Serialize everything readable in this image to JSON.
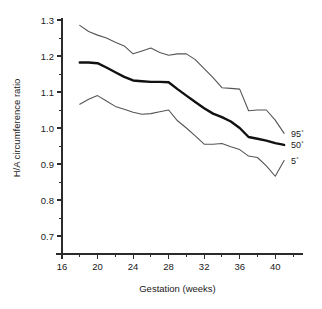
{
  "chart_data": {
    "type": "line",
    "title": "",
    "xlabel": "Gestation (weeks)",
    "ylabel": "H/A circumference ratio",
    "xlim": [
      16,
      42
    ],
    "ylim": [
      0.65,
      1.3
    ],
    "grid": false,
    "legend_position": "right-inline",
    "x_ticks_major": [
      16,
      20,
      24,
      28,
      32,
      36,
      40
    ],
    "x_ticks_minor": [
      18,
      22,
      26,
      30,
      34,
      38,
      42
    ],
    "y_ticks_major": [
      0.7,
      0.8,
      0.9,
      1.0,
      1.1,
      1.2,
      1.3
    ],
    "y_ticks_minor": [
      0.75,
      0.85,
      0.95,
      1.05,
      1.15,
      1.25
    ],
    "x_tick_labels": [
      "16",
      "20",
      "24",
      "28",
      "32",
      "36",
      "40"
    ],
    "y_tick_labels": [
      "0.7",
      "0.8",
      "0.9",
      "1.0",
      "1.1",
      "1.2",
      "1.3"
    ],
    "x": [
      18,
      19,
      20,
      21,
      22,
      23,
      24,
      25,
      26,
      27,
      28,
      29,
      30,
      31,
      32,
      33,
      34,
      35,
      36,
      37,
      38,
      39,
      40,
      41
    ],
    "series": [
      {
        "name": "95th percentile",
        "label": "95",
        "superscript": "°",
        "style": "thin",
        "color": "#555555",
        "values": [
          1.285,
          1.268,
          1.258,
          1.25,
          1.238,
          1.228,
          1.206,
          1.214,
          1.222,
          1.21,
          1.202,
          1.206,
          1.206,
          1.19,
          1.165,
          1.14,
          1.112,
          1.11,
          1.108,
          1.048,
          1.05,
          1.05,
          1.022,
          0.985
        ]
      },
      {
        "name": "50th percentile",
        "label": "50",
        "superscript": "°",
        "style": "bold",
        "color": "#111111",
        "values": [
          1.182,
          1.182,
          1.18,
          1.168,
          1.155,
          1.142,
          1.132,
          1.13,
          1.128,
          1.128,
          1.127,
          1.108,
          1.09,
          1.072,
          1.055,
          1.04,
          1.03,
          1.018,
          1.0,
          0.975,
          0.97,
          0.965,
          0.958,
          0.953
        ]
      },
      {
        "name": "5th percentile",
        "label": "5",
        "superscript": "°",
        "style": "thin",
        "color": "#555555",
        "values": [
          1.066,
          1.08,
          1.09,
          1.075,
          1.06,
          1.052,
          1.044,
          1.038,
          1.04,
          1.045,
          1.05,
          1.02,
          1.0,
          0.978,
          0.955,
          0.955,
          0.957,
          0.948,
          0.94,
          0.922,
          0.918,
          0.895,
          0.866,
          0.91
        ]
      }
    ]
  },
  "figure": {
    "background": "#ffffff",
    "axis_color": "#2b2b2b"
  }
}
